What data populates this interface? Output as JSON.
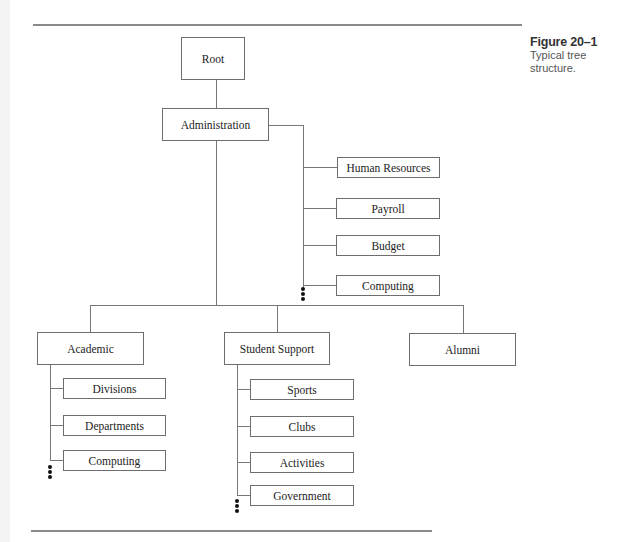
{
  "caption": {
    "figure_label": "Figure 20–1",
    "description": "Typical tree structure."
  },
  "tree": {
    "root": {
      "label": "Root"
    },
    "administration": {
      "label": "Administration",
      "children": [
        {
          "label": "Human Resources"
        },
        {
          "label": "Payroll"
        },
        {
          "label": "Budget"
        },
        {
          "label": "Computing"
        }
      ],
      "more_indicator": "⋮"
    },
    "academic": {
      "label": "Academic",
      "children": [
        {
          "label": "Divisions"
        },
        {
          "label": "Departments"
        },
        {
          "label": "Computing"
        }
      ],
      "more_indicator": "⋮"
    },
    "student_support": {
      "label": "Student Support",
      "children": [
        {
          "label": "Sports"
        },
        {
          "label": "Clubs"
        },
        {
          "label": "Activities"
        },
        {
          "label": "Government"
        }
      ],
      "more_indicator": "⋮"
    },
    "alumni": {
      "label": "Alumni"
    }
  },
  "colors": {
    "box_border": "#6e6e6e",
    "connector": "#777777",
    "rule": "#8a8a8a",
    "text": "#222222"
  }
}
